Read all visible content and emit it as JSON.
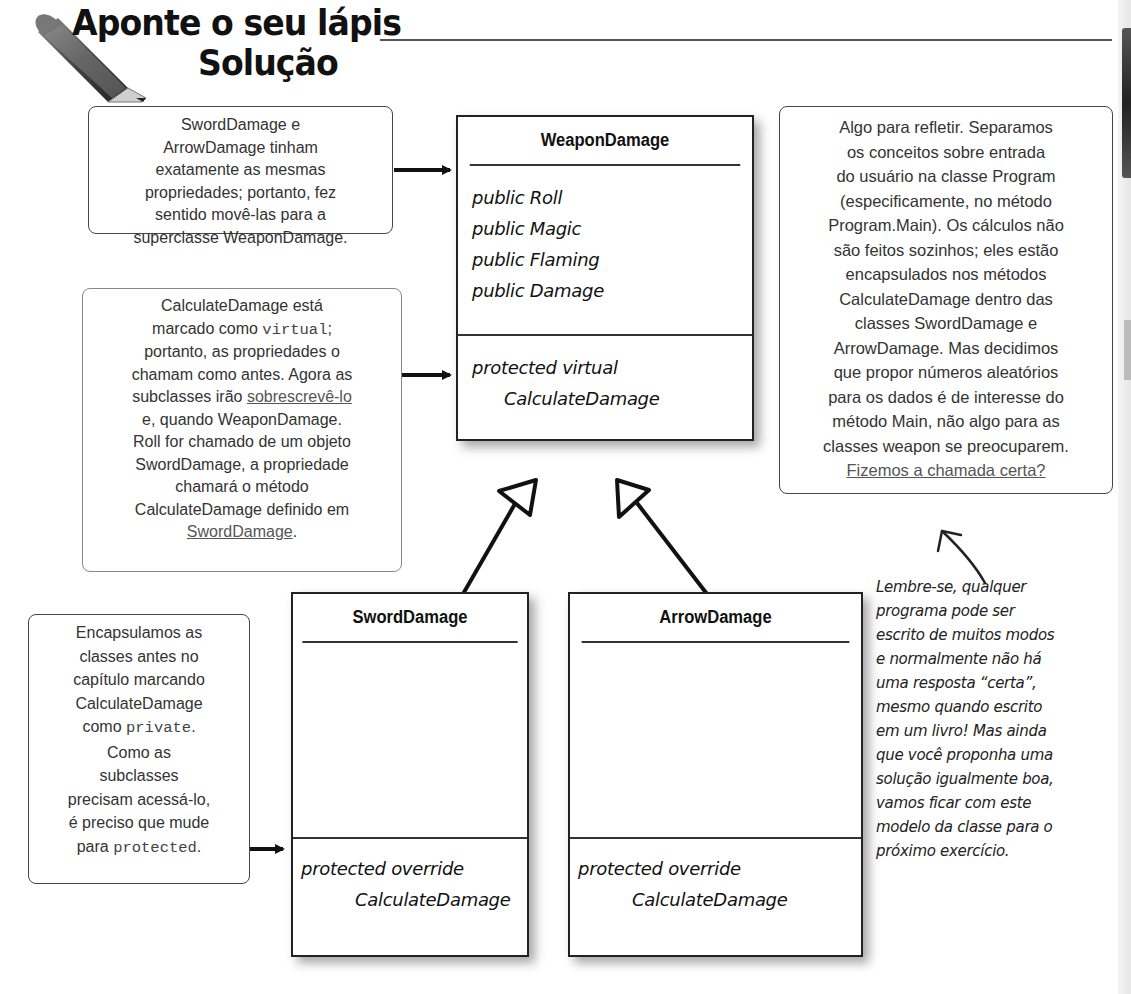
{
  "header": {
    "title_line1": "Aponte o seu lápis",
    "title_line2": "Solução",
    "icon": "pencil-icon"
  },
  "callouts": {
    "properties_note": {
      "lines": [
        "SwordDamage e",
        "ArrowDamage tinham",
        "exatamente as mesmas",
        "propriedades; portanto, fez",
        "sentido movê-las para a",
        "superclasse WeaponDamage."
      ]
    },
    "virtual_note": {
      "line1": "CalculateDamage está",
      "line2_pre": "marcado como ",
      "line2_code": "virtual",
      "line2_post": ";",
      "line3": "portanto, as propriedades o",
      "line4": "chamam como antes. Agora as",
      "line5_pre": "subclasses irão ",
      "line5_link": "sobrescrevê-lo",
      "line6": "e, quando WeaponDamage.",
      "line7": "Roll for chamado de um objeto",
      "line8": "SwordDamage, a propriedade",
      "line9": "chamará o método",
      "line10": "CalculateDamage definido em",
      "line11_link": "SwordDamage",
      "line11_post": "."
    },
    "reflect_note": {
      "lines": [
        "Algo para refletir. Separamos",
        "os conceitos sobre entrada",
        "do usuário na classe Program",
        "(especificamente, no método",
        "Program.Main). Os cálculos não",
        "são feitos sozinhos; eles estão",
        "encapsulados nos métodos",
        "CalculateDamage dentro das",
        "classes SwordDamage e",
        "ArrowDamage. Mas decidimos",
        "que propor números aleatórios",
        "para os dados é de interesse do",
        "método Main, não algo para as",
        "classes weapon se preocuparem."
      ],
      "link": "Fizemos a chamada certa?"
    },
    "encapsulate_note": {
      "line1": "Encapsulamos as",
      "line2": "classes antes no",
      "line3": "capítulo marcando",
      "line4": "CalculateDamage",
      "line5_pre": "como ",
      "line5_code": "private",
      "line5_post": ".",
      "line6": "Como as",
      "line7": "subclasses",
      "line8": "precisam acessá-lo,",
      "line9": "é preciso que mude",
      "line10_pre": "para ",
      "line10_code": "protected",
      "line10_post": "."
    },
    "handwritten_note": {
      "lines": [
        "Lembre-se, qualquer",
        "programa pode ser",
        "escrito de muitos modos",
        "e normalmente não há",
        "uma resposta “certa”,",
        "mesmo quando escrito",
        "em um livro! Mas ainda",
        "que você proponha uma",
        "solução igualmente boa,",
        "vamos ficar com este",
        "modelo da classe para o",
        "próximo exercício."
      ]
    }
  },
  "classes": {
    "weapon_damage": {
      "name": "WeaponDamage",
      "properties": [
        "public Roll",
        "public Magic",
        "public Flaming",
        "public Damage"
      ],
      "methods": [
        "protected virtual",
        "CalculateDamage"
      ]
    },
    "sword_damage": {
      "name": "SwordDamage",
      "methods": [
        "protected override",
        "CalculateDamage"
      ]
    },
    "arrow_damage": {
      "name": "ArrowDamage",
      "methods": [
        "protected override",
        "CalculateDamage"
      ]
    }
  },
  "colors": {
    "ink": "#222222",
    "callout_border": "#444444",
    "text": "#333333",
    "background": "#ffffff"
  }
}
